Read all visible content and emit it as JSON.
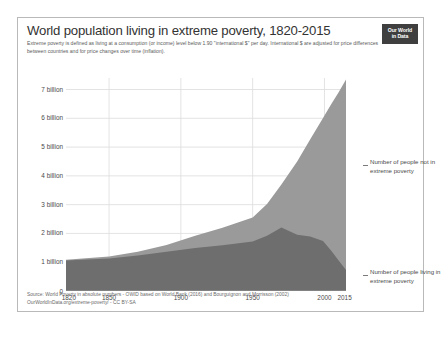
{
  "header": {
    "title": "World population living in extreme poverty, 1820-2015",
    "subtitle": "Extreme poverty is defined as living at a consumption (or income) level below 1.90 \"international $\" per day. International $ are adjusted for price differences between countries and for price changes over time (inflation).",
    "logo_line1": "Our World",
    "logo_line2": "in Data"
  },
  "legend": {
    "top": "Number of people not in extreme poverty",
    "bottom": "Number of people living in extreme poverty"
  },
  "footer": {
    "source": "Source: World Poverty in absolute numbers - OWID based on World Bank (2016) and Bourguignon and Morrisson (2002)",
    "license": "OurWorldInData.org/extreme-poverty/ - CC BY-SA"
  },
  "colors": {
    "not_in_poverty": "#9a9a9a",
    "in_poverty": "#6e6e6e",
    "grid": "#dcdcdc",
    "text": "#4a4a4a",
    "frame": "#b9b9b9"
  },
  "chart_data": {
    "type": "area",
    "title": "World population living in extreme poverty, 1820-2015",
    "subtitle": "Extreme poverty is defined as living at a consumption (or income) level below 1.90 \"international $\" per day. International $ are adjusted for price differences between countries and for price changes over time (inflation).",
    "stacked": true,
    "xlabel": "",
    "ylabel": "",
    "xlim": [
      1820,
      2015
    ],
    "ylim": [
      0,
      7.4
    ],
    "yunit": "billion people",
    "grid": true,
    "legend_position": "right",
    "xticks": [
      1820,
      1850,
      1900,
      1950,
      2000,
      2015
    ],
    "xticklabels": [
      "1820",
      "1850",
      "1900",
      "1950",
      "2000",
      "2015"
    ],
    "yticks": [
      0,
      1,
      2,
      3,
      4,
      5,
      6,
      7
    ],
    "yticklabels": [
      "0",
      "1 billion",
      "2 billion",
      "3 billion",
      "4 billion",
      "5 billion",
      "6 billion",
      "7 billion"
    ],
    "x": [
      1820,
      1850,
      1870,
      1890,
      1910,
      1929,
      1950,
      1960,
      1970,
      1981,
      1990,
      1999,
      2005,
      2010,
      2015
    ],
    "series": [
      {
        "name": "Number of people living in extreme poverty",
        "color": "#6e6e6e",
        "values": [
          1.06,
          1.13,
          1.23,
          1.36,
          1.49,
          1.59,
          1.72,
          1.92,
          2.21,
          1.95,
          1.89,
          1.74,
          1.38,
          1.05,
          0.73
        ]
      },
      {
        "name": "Number of people not in extreme poverty",
        "color": "#9a9a9a",
        "values": [
          0.03,
          0.07,
          0.13,
          0.24,
          0.43,
          0.61,
          0.83,
          1.1,
          1.49,
          2.55,
          3.37,
          4.27,
          5.13,
          5.86,
          6.62
        ]
      }
    ],
    "totals": [
      1.09,
      1.2,
      1.36,
      1.6,
      1.92,
      2.2,
      2.55,
      3.02,
      3.7,
      4.5,
      5.26,
      6.01,
      6.51,
      6.91,
      7.35
    ]
  }
}
